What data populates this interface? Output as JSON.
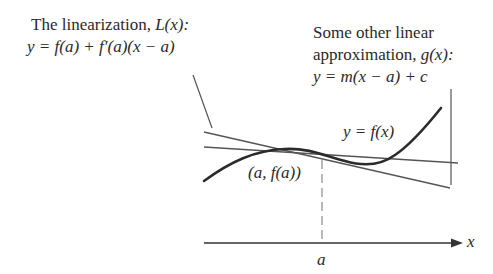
{
  "left_annotation": {
    "line1_text": "The linearization, ",
    "line1_func": "L(x):",
    "line2": "y = f(a) + f′(a)(x − a)"
  },
  "right_annotation": {
    "line1": "Some other linear",
    "line2_text": "approximation, ",
    "line2_func": "g(x):",
    "line3": "y = m(x − a) + c"
  },
  "curve_label": "y = f(x)",
  "point_label": "(a, f(a))",
  "axis": {
    "x_label": "x",
    "tick_label": "a"
  },
  "colors": {
    "curve": "#2b2b2b",
    "lines": "#555555",
    "dashed": "#8a8a8a",
    "text": "#2a2a2a"
  }
}
